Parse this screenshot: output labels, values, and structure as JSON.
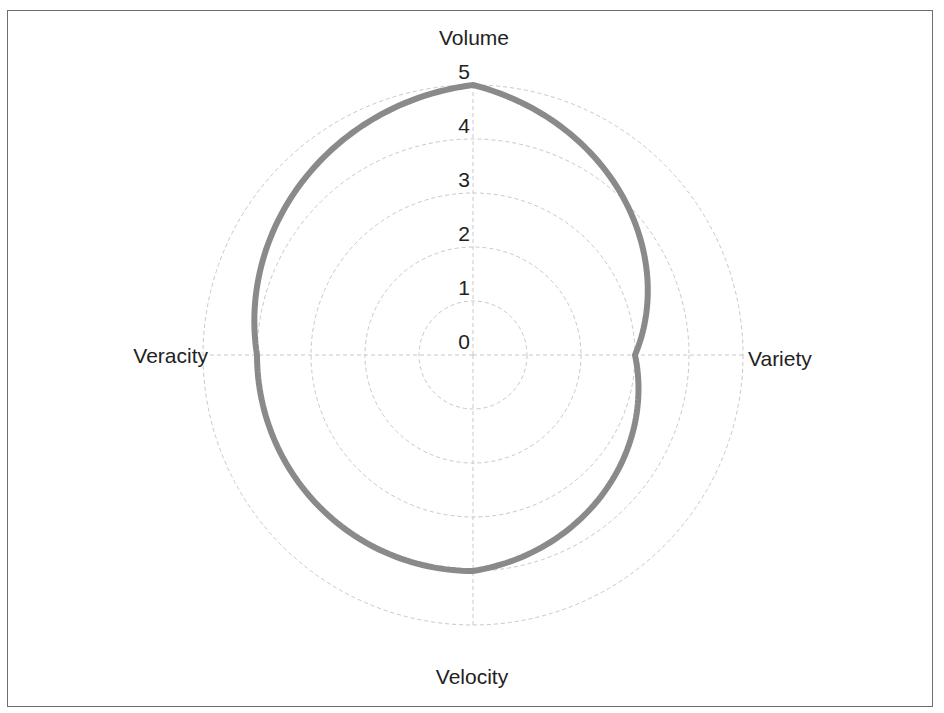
{
  "chart_data": {
    "type": "radar",
    "title": "",
    "categories": [
      "Volume",
      "Variety",
      "Velocity",
      "Veracity"
    ],
    "series": [
      {
        "name": "",
        "values": [
          5,
          3,
          4,
          4
        ],
        "color": "#8a8a8a"
      }
    ],
    "radial_ticks": [
      "0",
      "1",
      "2",
      "3",
      "4",
      "5"
    ],
    "rlim": [
      0,
      5
    ],
    "grid": true,
    "grid_style": "dashed",
    "legend": "none",
    "interpolation": "linear-in-polar (curved arcs)"
  },
  "colors": {
    "line": "#8a8a8a",
    "grid": "#c8c8c8",
    "border": "#6e6e6e",
    "text": "#222222"
  }
}
